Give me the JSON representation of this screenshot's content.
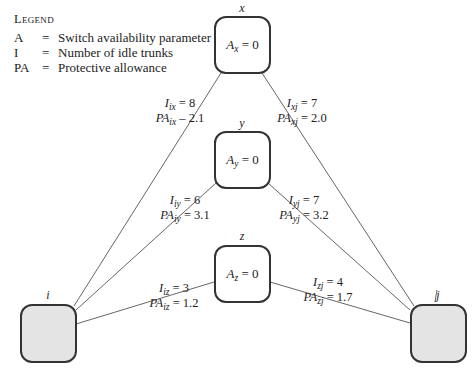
{
  "legend": {
    "title": "Legend",
    "items": [
      {
        "symbol": "A",
        "eq": "=",
        "meaning": "Switch availability parameter"
      },
      {
        "symbol": "I",
        "eq": "=",
        "meaning": "Number of idle trunks"
      },
      {
        "symbol": "PA",
        "eq": "=",
        "meaning": "Protective allowance"
      }
    ]
  },
  "nodes": {
    "x": {
      "label": "x",
      "var": "A",
      "sub": "x",
      "value": "= 0"
    },
    "y": {
      "label": "y",
      "var": "A",
      "sub": "y",
      "value": "= 0"
    },
    "z": {
      "label": "z",
      "var": "A",
      "sub": "z",
      "value": "= 0"
    },
    "i": {
      "label": "i"
    },
    "j": {
      "label": "j"
    }
  },
  "edges": {
    "ix": {
      "I_sub": "ix",
      "I_val": "= 8",
      "PA_sub": "ix",
      "PA_val": "– 2.1"
    },
    "xj": {
      "I_sub": "xj",
      "I_val": "= 7",
      "PA_sub": "xj",
      "PA_val": "= 2.0"
    },
    "iy": {
      "I_sub": "iy",
      "I_val": "= 6",
      "PA_sub": "iy",
      "PA_val": "= 3.1"
    },
    "yj": {
      "I_sub": "yj",
      "I_val": "= 7",
      "PA_sub": "yj",
      "PA_val": "= 3.2"
    },
    "iz": {
      "I_sub": "iz",
      "I_val": "= 3",
      "PA_sub": "iz",
      "PA_val": "= 1.2"
    },
    "zj": {
      "I_sub": "zj",
      "I_val": "= 4",
      "PA_sub": "zj",
      "PA_val": "= 1.7"
    }
  },
  "symbols": {
    "I": "I",
    "PA": "PA"
  }
}
